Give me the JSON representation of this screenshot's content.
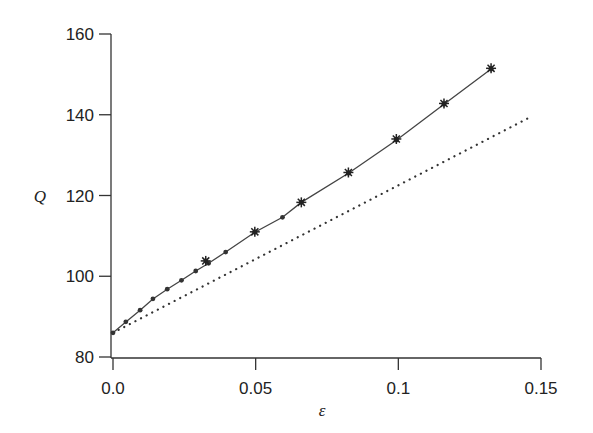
{
  "chart_data": {
    "type": "line",
    "title": "",
    "xlabel": "ε",
    "ylabel": "Q",
    "xlim": [
      0,
      0.15
    ],
    "ylim": [
      80,
      160
    ],
    "xticks": [
      0.0,
      0.05,
      0.1,
      0.15
    ],
    "xtick_labels": [
      "0.0",
      "0.05",
      "0.1",
      "0.15"
    ],
    "yticks": [
      80,
      100,
      120,
      140,
      160
    ],
    "ytick_labels": [
      "80",
      "100",
      "120",
      "140",
      "160"
    ],
    "grid": false,
    "legend": null,
    "series": [
      {
        "name": "numerical (dots)",
        "style": "solid line with dot markers",
        "x": [
          0.0,
          0.0045,
          0.0095,
          0.014,
          0.019,
          0.024,
          0.029,
          0.0335,
          0.0395,
          0.0497,
          0.0594,
          0.066,
          0.0825,
          0.0993,
          0.116,
          0.1325
        ],
        "y": [
          86.0,
          88.7,
          91.6,
          94.4,
          96.8,
          99.0,
          101.3,
          103.2,
          106.0,
          110.9,
          114.6,
          118.3,
          125.5,
          133.7,
          142.6,
          151.3
        ]
      },
      {
        "name": "data (stars)",
        "style": "star markers",
        "x": [
          0.0325,
          0.0497,
          0.066,
          0.0825,
          0.0993,
          0.116,
          0.1325
        ],
        "y": [
          103.8,
          111.0,
          118.3,
          125.7,
          134.0,
          142.8,
          151.5
        ]
      },
      {
        "name": "linear approximation",
        "style": "dotted line",
        "x": [
          0.0,
          0.147
        ],
        "y": [
          86.0,
          139.7
        ]
      }
    ]
  }
}
